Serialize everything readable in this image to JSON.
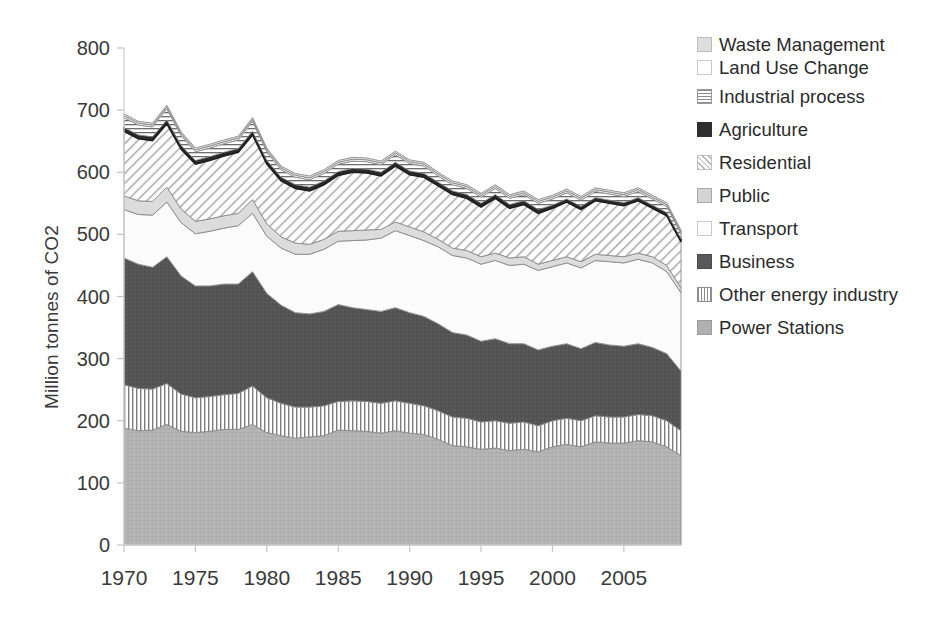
{
  "axes": {
    "ylabel": "Million tonnes of CO2",
    "yticks": [
      "0",
      "100",
      "200",
      "300",
      "400",
      "500",
      "600",
      "700",
      "800"
    ],
    "xticks": [
      "1970",
      "1975",
      "1980",
      "1985",
      "1990",
      "1995",
      "2000",
      "2005"
    ]
  },
  "legend": {
    "items": [
      {
        "label": "Waste Management",
        "swatch": "waste-swatch",
        "cls": "lg-waste"
      },
      {
        "label": "Land Use Change",
        "swatch": "land-use-change-swatch",
        "cls": "lg-land"
      },
      {
        "label": "Industrial process",
        "swatch": "industrial-process-swatch",
        "cls": "lg-indus"
      },
      {
        "label": "Agriculture",
        "swatch": "agriculture-swatch",
        "cls": "lg-agri"
      },
      {
        "label": "Residential",
        "swatch": "residential-swatch",
        "cls": "lg-resi"
      },
      {
        "label": "Public",
        "swatch": "public-swatch",
        "cls": "lg-public"
      },
      {
        "label": "Transport",
        "swatch": "transport-swatch",
        "cls": "lg-transport"
      },
      {
        "label": "Business",
        "swatch": "business-swatch",
        "cls": "lg-business"
      },
      {
        "label": "Other energy industry",
        "swatch": "other-energy-industry-swatch",
        "cls": "lg-otherenergy"
      },
      {
        "label": "Power Stations",
        "swatch": "power-stations-swatch",
        "cls": "lg-power"
      }
    ]
  },
  "chart_data": {
    "type": "area",
    "stacked": true,
    "title": "",
    "xlabel": "",
    "ylabel": "Million tonnes of CO2",
    "xlim": [
      1970,
      2009
    ],
    "ylim": [
      0,
      800
    ],
    "grid": false,
    "legend_position": "right",
    "x": [
      1970,
      1971,
      1972,
      1973,
      1974,
      1975,
      1976,
      1977,
      1978,
      1979,
      1980,
      1981,
      1982,
      1983,
      1984,
      1985,
      1986,
      1987,
      1988,
      1989,
      1990,
      1991,
      1992,
      1993,
      1994,
      1995,
      1996,
      1997,
      1998,
      1999,
      2000,
      2001,
      2002,
      2003,
      2004,
      2005,
      2006,
      2007,
      2008,
      2009
    ],
    "series": [
      {
        "name": "Power Stations",
        "values": [
          188,
          184,
          185,
          194,
          183,
          181,
          183,
          186,
          186,
          194,
          181,
          176,
          172,
          174,
          176,
          185,
          184,
          183,
          180,
          184,
          180,
          178,
          170,
          160,
          158,
          154,
          156,
          152,
          154,
          150,
          158,
          162,
          158,
          166,
          164,
          164,
          168,
          166,
          158,
          144
        ]
      },
      {
        "name": "Other energy industry",
        "values": [
          70,
          68,
          66,
          66,
          60,
          56,
          56,
          56,
          58,
          62,
          56,
          52,
          50,
          48,
          48,
          46,
          48,
          48,
          48,
          48,
          48,
          46,
          46,
          46,
          46,
          44,
          44,
          44,
          44,
          42,
          42,
          42,
          42,
          42,
          42,
          42,
          42,
          42,
          42,
          40
        ]
      },
      {
        "name": "Business",
        "values": [
          204,
          200,
          196,
          204,
          190,
          180,
          178,
          178,
          176,
          184,
          168,
          158,
          152,
          150,
          152,
          156,
          150,
          148,
          148,
          150,
          146,
          144,
          140,
          136,
          134,
          130,
          132,
          128,
          126,
          122,
          120,
          120,
          116,
          118,
          116,
          114,
          114,
          110,
          108,
          96
        ]
      },
      {
        "name": "Transport",
        "values": [
          78,
          80,
          84,
          88,
          86,
          84,
          88,
          90,
          94,
          94,
          92,
          92,
          94,
          96,
          100,
          102,
          108,
          112,
          118,
          124,
          124,
          122,
          124,
          124,
          124,
          124,
          126,
          126,
          128,
          128,
          128,
          130,
          130,
          132,
          134,
          134,
          136,
          136,
          132,
          126
        ]
      },
      {
        "name": "Public",
        "values": [
          22,
          22,
          22,
          24,
          22,
          20,
          20,
          20,
          20,
          22,
          20,
          18,
          18,
          16,
          16,
          16,
          16,
          16,
          14,
          14,
          14,
          14,
          12,
          12,
          12,
          12,
          12,
          12,
          12,
          10,
          10,
          10,
          10,
          10,
          10,
          10,
          10,
          10,
          10,
          8
        ]
      },
      {
        "name": "Residential",
        "values": [
          104,
          100,
          98,
          102,
          96,
          92,
          94,
          96,
          98,
          104,
          96,
          90,
          88,
          86,
          88,
          90,
          94,
          92,
          86,
          90,
          84,
          88,
          86,
          86,
          84,
          80,
          88,
          80,
          84,
          82,
          84,
          88,
          84,
          86,
          84,
          82,
          84,
          78,
          80,
          74
        ]
      },
      {
        "name": "Agriculture",
        "values": [
          6,
          6,
          6,
          6,
          6,
          6,
          6,
          6,
          6,
          6,
          6,
          6,
          6,
          6,
          6,
          6,
          6,
          6,
          6,
          6,
          6,
          6,
          6,
          6,
          6,
          6,
          6,
          6,
          6,
          6,
          5,
          5,
          5,
          5,
          5,
          5,
          5,
          5,
          5,
          5
        ]
      },
      {
        "name": "Industrial process",
        "values": [
          16,
          16,
          16,
          18,
          16,
          14,
          14,
          14,
          14,
          16,
          14,
          12,
          12,
          12,
          12,
          12,
          12,
          12,
          12,
          12,
          12,
          12,
          10,
          10,
          10,
          10,
          10,
          10,
          10,
          10,
          10,
          10,
          10,
          10,
          10,
          10,
          10,
          10,
          10,
          8
        ]
      },
      {
        "name": "Land Use Change",
        "values": [
          3,
          3,
          3,
          3,
          3,
          3,
          3,
          3,
          3,
          3,
          3,
          3,
          3,
          3,
          3,
          3,
          3,
          3,
          3,
          3,
          3,
          3,
          3,
          3,
          3,
          3,
          3,
          3,
          3,
          3,
          3,
          3,
          3,
          3,
          3,
          3,
          3,
          3,
          3,
          3
        ]
      },
      {
        "name": "Waste Management",
        "values": [
          3,
          3,
          3,
          3,
          3,
          3,
          3,
          3,
          3,
          3,
          3,
          3,
          3,
          3,
          3,
          3,
          3,
          3,
          3,
          3,
          3,
          3,
          3,
          3,
          3,
          3,
          3,
          3,
          3,
          3,
          3,
          3,
          3,
          3,
          3,
          3,
          3,
          3,
          3,
          3
        ]
      }
    ],
    "series_styles": [
      {
        "name": "Power Stations",
        "fill": "#b0b0b0",
        "pattern": "speckle-medium"
      },
      {
        "name": "Other energy industry",
        "fill": "#ffffff",
        "pattern": "vertical-lines"
      },
      {
        "name": "Business",
        "fill": "#555555",
        "pattern": "speckle-dark"
      },
      {
        "name": "Transport",
        "fill": "#fbfbfb",
        "pattern": "plain"
      },
      {
        "name": "Public",
        "fill": "#dcdcdc",
        "pattern": "plain-light"
      },
      {
        "name": "Residential",
        "fill": "#ffffff",
        "pattern": "diagonal-hatch"
      },
      {
        "name": "Agriculture",
        "fill": "#2a2a2a",
        "pattern": "solid-dark"
      },
      {
        "name": "Industrial process",
        "fill": "#ffffff",
        "pattern": "horizontal-lines"
      },
      {
        "name": "Land Use Change",
        "fill": "#ffffff",
        "pattern": "plain"
      },
      {
        "name": "Waste Management",
        "fill": "#e2e2e2",
        "pattern": "speckle-light"
      }
    ]
  }
}
